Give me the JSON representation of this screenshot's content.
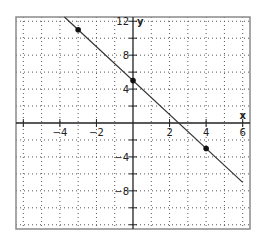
{
  "chart_data": {
    "type": "line",
    "title": "",
    "xlabel": "x",
    "ylabel": "y",
    "xlim": [
      -6.4,
      6.4
    ],
    "ylim": [
      -12.5,
      12.5
    ],
    "x_ticks": [
      -4,
      -2,
      2,
      4,
      6
    ],
    "y_ticks": [
      12,
      8,
      4,
      -4,
      -8
    ],
    "x_minor_ticks": [
      -6,
      -4,
      -2,
      2,
      4,
      6
    ],
    "y_minor_ticks": [
      -12,
      -10,
      -8,
      -6,
      -4,
      -2,
      2,
      4,
      6,
      8,
      10,
      12
    ],
    "grid": true,
    "grid_x_step": 1,
    "grid_y_step": 2,
    "legend": null,
    "series": [
      {
        "name": "y = -2x + 5",
        "line": {
          "x": [
            -3.75,
            6
          ],
          "y": [
            12.5,
            -7
          ]
        },
        "points": [
          {
            "x": -3,
            "y": 11
          },
          {
            "x": 0,
            "y": 5
          },
          {
            "x": 4,
            "y": -3
          }
        ]
      }
    ]
  },
  "colors": {
    "frame": "#8a8a8a",
    "grid": "#555555",
    "axis": "#222222",
    "line": "#333333",
    "point": "#111111"
  }
}
